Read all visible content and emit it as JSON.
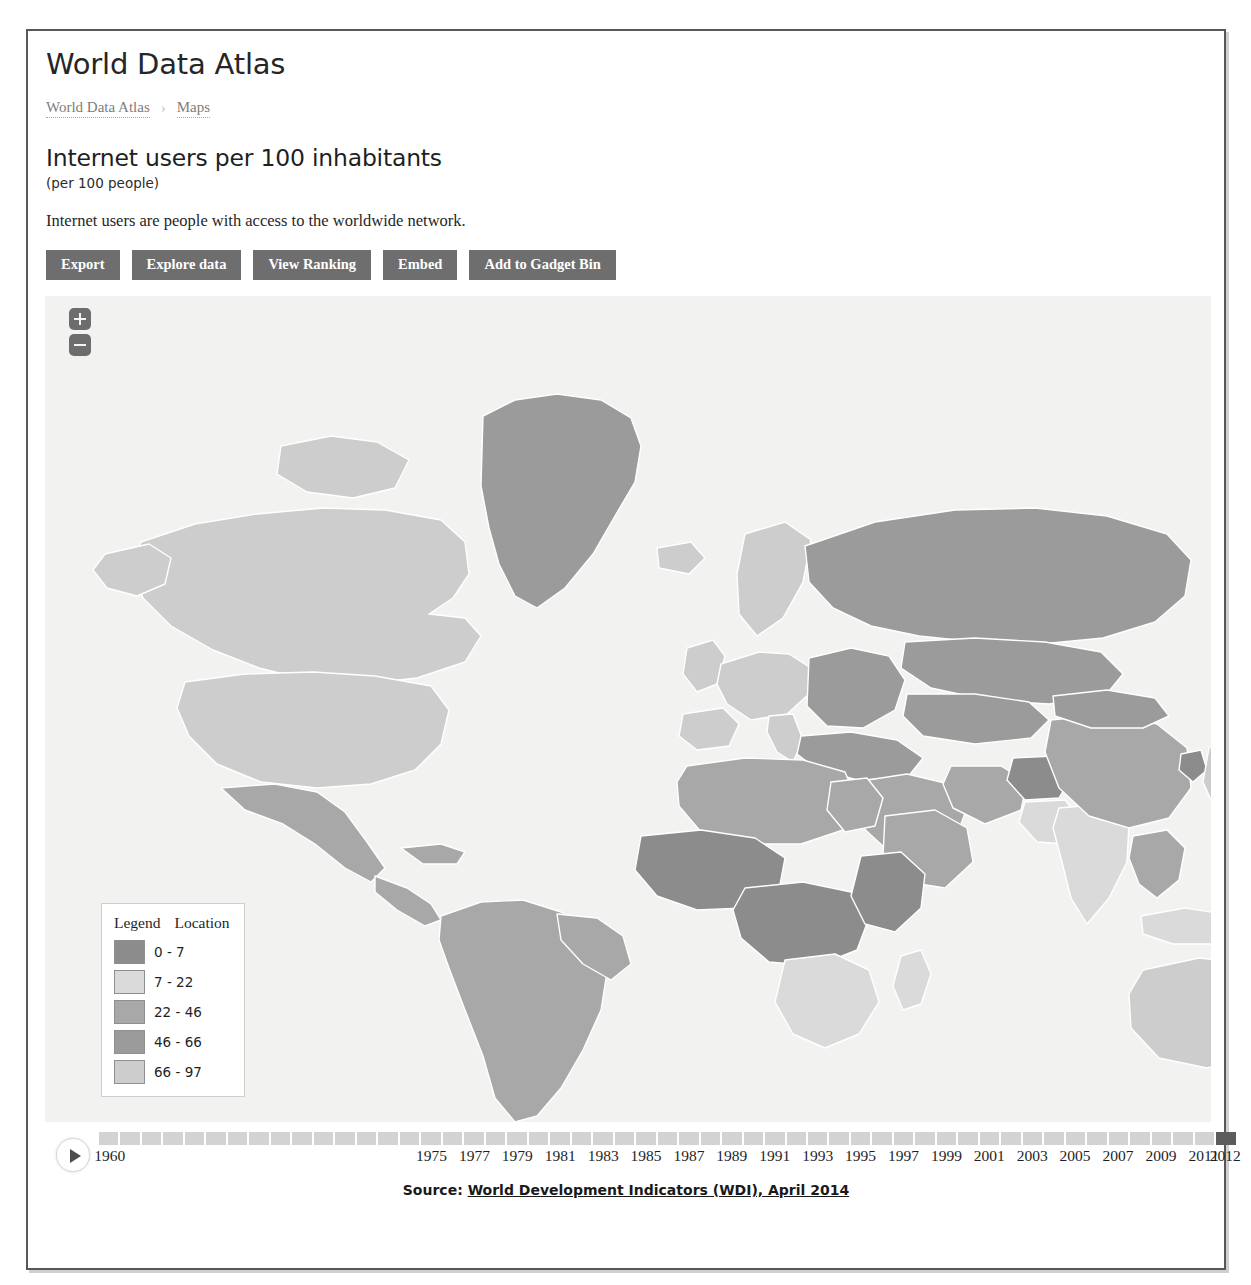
{
  "app": {
    "title": "World Data Atlas"
  },
  "breadcrumb": {
    "items": [
      {
        "label": "World Data Atlas"
      },
      {
        "label": "Maps"
      }
    ],
    "separator": "›"
  },
  "indicator": {
    "title": "Internet users per 100 inhabitants",
    "unit": "(per 100 people)",
    "description": "Internet users are people with access to the worldwide network."
  },
  "toolbar": {
    "buttons": [
      {
        "label": "Export",
        "name": "export-button"
      },
      {
        "label": "Explore data",
        "name": "explore-data-button"
      },
      {
        "label": "View Ranking",
        "name": "view-ranking-button"
      },
      {
        "label": "Embed",
        "name": "embed-button"
      },
      {
        "label": "Add to Gadget Bin",
        "name": "add-to-gadget-bin-button"
      }
    ]
  },
  "map": {
    "background": "#f2f2f0",
    "border_color": "#ffffff",
    "zoom_in_label": "+",
    "zoom_out_label": "-"
  },
  "legend": {
    "header_left": "Legend",
    "header_right": "Location",
    "bins": [
      {
        "label": "0 - 7",
        "color": "#8c8c8c"
      },
      {
        "label": "7 - 22",
        "color": "#dadada"
      },
      {
        "label": "22 - 46",
        "color": "#a8a8a8"
      },
      {
        "label": "46 - 66",
        "color": "#9b9b9b"
      },
      {
        "label": "66 - 97",
        "color": "#cdcdcd"
      }
    ]
  },
  "timeline": {
    "play_label": "play",
    "selected_year": "2012",
    "tick_color": "#d3d3d3",
    "selected_color": "#5c5c5c",
    "years_all": [
      "1960",
      "1961",
      "1962",
      "1963",
      "1964",
      "1965",
      "1966",
      "1967",
      "1968",
      "1969",
      "1970",
      "1971",
      "1972",
      "1973",
      "1974",
      "1975",
      "1976",
      "1977",
      "1978",
      "1979",
      "1980",
      "1981",
      "1982",
      "1983",
      "1984",
      "1985",
      "1986",
      "1987",
      "1988",
      "1989",
      "1990",
      "1991",
      "1992",
      "1993",
      "1994",
      "1995",
      "1996",
      "1997",
      "1998",
      "1999",
      "2000",
      "2001",
      "2002",
      "2003",
      "2004",
      "2005",
      "2006",
      "2007",
      "2008",
      "2009",
      "2010",
      "2011",
      "2012"
    ],
    "labeled_years": [
      "1960",
      "1975",
      "1977",
      "1979",
      "1981",
      "1983",
      "1985",
      "1987",
      "1989",
      "1991",
      "1993",
      "1995",
      "1997",
      "1999",
      "2001",
      "2003",
      "2005",
      "2007",
      "2009",
      "2011",
      "2012"
    ]
  },
  "source": {
    "prefix": "Source:",
    "link_text": "World Development Indicators (WDI), April 2014"
  },
  "chart_data": {
    "type": "map",
    "title": "Internet users per 100 inhabitants",
    "unit": "per 100 people",
    "year": "2012",
    "bins": [
      "0 - 7",
      "7 - 22",
      "22 - 46",
      "46 - 66",
      "66 - 97"
    ],
    "bin_colors": [
      "#8c8c8c",
      "#dadada",
      "#a8a8a8",
      "#9b9b9b",
      "#cdcdcd"
    ],
    "legend_position": "bottom-left",
    "regions": [
      {
        "name": "North America",
        "bin": "66 - 97"
      },
      {
        "name": "Greenland",
        "bin": "46 - 66"
      },
      {
        "name": "South America",
        "bin": "22 - 46"
      },
      {
        "name": "Western Europe",
        "bin": "66 - 97"
      },
      {
        "name": "Eastern Europe",
        "bin": "46 - 66"
      },
      {
        "name": "Russia",
        "bin": "46 - 66"
      },
      {
        "name": "China",
        "bin": "22 - 46"
      },
      {
        "name": "India",
        "bin": "7 - 22"
      },
      {
        "name": "Central Africa",
        "bin": "0 - 7"
      },
      {
        "name": "North Africa",
        "bin": "22 - 46"
      },
      {
        "name": "Australia",
        "bin": "66 - 97"
      },
      {
        "name": "Japan",
        "bin": "66 - 97"
      }
    ]
  }
}
